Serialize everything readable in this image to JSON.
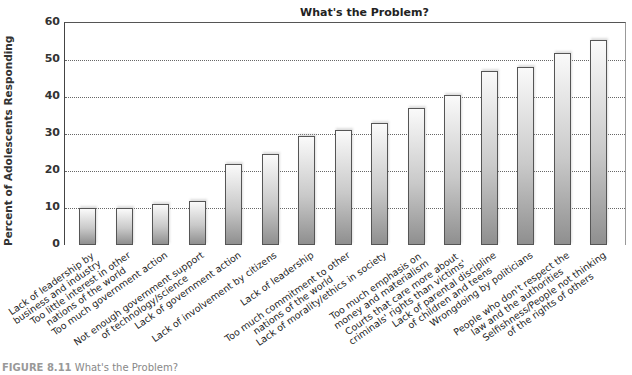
{
  "chart_data": {
    "type": "bar",
    "title": "What's the Problem?",
    "xlabel": "",
    "ylabel": "Percent of Adolescents Responding",
    "ylim": [
      0,
      60
    ],
    "yticks": [
      0,
      10,
      20,
      30,
      40,
      50,
      60
    ],
    "grid": true,
    "legend": null,
    "categories": [
      "Lack of leadership by business and industry",
      "Too little interest in other nations of the world",
      "Too much government action",
      "Not enough government support of technology/science",
      "Lack of government action",
      "Lack of involvement by citizens",
      "Lack of leadership",
      "Too much commitment to other nations of the world",
      "Lack of morality/ethics in society",
      "Too much emphasis on money and materialism",
      "Courts that care more about criminals' rights than victims'",
      "Lack of parental discipline of children and teens",
      "Wrongdoing by politicians",
      "People who don't respect the law and the authorities",
      "Selfishness/People not thinking of the rights of others"
    ],
    "category_lines": [
      [
        "Lack of leadership by",
        "business and industry"
      ],
      [
        "Too little interest in other",
        "nations of the world"
      ],
      [
        "Too much government action"
      ],
      [
        "Not enough government support",
        "of technology/science"
      ],
      [
        "Lack of government action"
      ],
      [
        "Lack of involvement by citizens"
      ],
      [
        "Lack of leadership"
      ],
      [
        "Too much commitment to other",
        "nations of the world"
      ],
      [
        "Lack of morality/ethics in society"
      ],
      [
        "Too much emphasis on",
        "money and materialism"
      ],
      [
        "Courts that care more about",
        "criminals' rights than victims'"
      ],
      [
        "Lack of parental discipline",
        "of children and teens"
      ],
      [
        "Wrongdoing by politicians"
      ],
      [
        "People who don't respect the",
        "law and the authorities"
      ],
      [
        "Selfishness/People not thinking",
        "of the rights of others"
      ]
    ],
    "values": [
      10,
      10,
      11,
      12,
      22,
      24.5,
      29.5,
      31,
      33,
      37,
      40.5,
      47,
      48,
      52,
      55.5
    ]
  },
  "caption": {
    "label": "FIGURE 8.11",
    "text": "What's the Problem?"
  }
}
